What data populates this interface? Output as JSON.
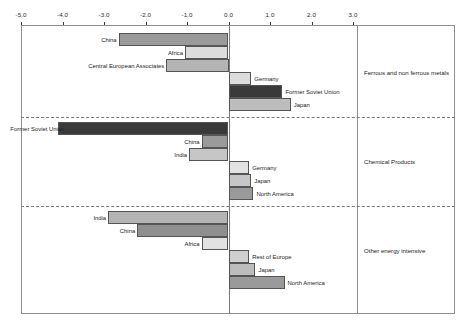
{
  "chart_data": {
    "type": "bar",
    "orientation": "horizontal",
    "title": "",
    "subtitle": "",
    "xlabel": "",
    "ylabel": "",
    "xlim": [
      -5.0,
      3.0
    ],
    "xticks": [
      -5.0,
      -4.0,
      -3.0,
      -2.0,
      -1.0,
      0.0,
      1.0,
      2.0,
      3.0
    ],
    "xtick_labels": [
      "-5.0",
      "-4.0",
      "-3.0",
      "-2.0",
      "-1.0",
      "0.0",
      "1.0",
      "2.0",
      "3.0"
    ],
    "grid": false,
    "legend": "none",
    "zero_reference_line": true,
    "groups": [
      {
        "caption": "Ferrous and non ferrous metals",
        "bars": [
          {
            "label": "China",
            "value": -2.65,
            "shade": "#9a9a9a"
          },
          {
            "label": "Africa",
            "value": -1.05,
            "shade": "#dcdcdc"
          },
          {
            "label": "Central European Associates",
            "value": -1.5,
            "shade": "#b4b4b4"
          },
          {
            "label": "Germany",
            "value": 0.55,
            "shade": "#dcdcdc"
          },
          {
            "label": "Former Soviet Union",
            "value": 1.3,
            "shade": "#3a3a3a"
          },
          {
            "label": "Japan",
            "value": 1.5,
            "shade": "#bdbdbd"
          }
        ]
      },
      {
        "caption": "Chemical Products",
        "bars": [
          {
            "label": "Former Soviet Union",
            "value": -4.1,
            "shade": "#3a3a3a"
          },
          {
            "label": "China",
            "value": -0.65,
            "shade": "#9a9a9a"
          },
          {
            "label": "India",
            "value": -0.95,
            "shade": "#c6c6c6"
          },
          {
            "label": "Germany",
            "value": 0.5,
            "shade": "#e2e2e2"
          },
          {
            "label": "Japan",
            "value": 0.55,
            "shade": "#c6c6c6"
          },
          {
            "label": "North America",
            "value": 0.6,
            "shade": "#9a9a9a"
          }
        ]
      },
      {
        "caption": "Other energy intensive",
        "bars": [
          {
            "label": "India",
            "value": -2.9,
            "shade": "#b4b4b4"
          },
          {
            "label": "China",
            "value": -2.2,
            "shade": "#8f8f8f"
          },
          {
            "label": "Africa",
            "value": -0.65,
            "shade": "#e2e2e2"
          },
          {
            "label": "Rest of Europe",
            "value": 0.5,
            "shade": "#cfcfcf"
          },
          {
            "label": "Japan",
            "value": 0.65,
            "shade": "#bdbdbd"
          },
          {
            "label": "North America",
            "value": 1.35,
            "shade": "#9a9a9a"
          }
        ]
      }
    ],
    "colors": {
      "axis": "#3b3b3b",
      "frame": "#8f8f8f",
      "bar_outline": "#555555",
      "separator": "#7a7a7a",
      "text": "#1d1d1d"
    }
  }
}
